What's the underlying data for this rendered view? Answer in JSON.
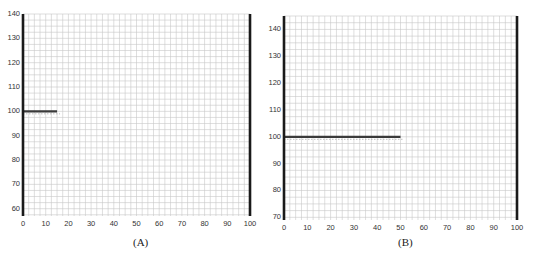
{
  "chart_data": [
    {
      "type": "line",
      "panel_label": "(A)",
      "xlim": [
        0,
        100
      ],
      "ylim": [
        57,
        140
      ],
      "xticks": [
        0,
        10,
        20,
        30,
        40,
        50,
        60,
        70,
        80,
        90,
        100
      ],
      "yticks": [
        60,
        70,
        80,
        90,
        100,
        110,
        120,
        130,
        140
      ],
      "grid": true,
      "xlabel": "",
      "ylabel": "",
      "series": [
        {
          "name": "segment",
          "x": [
            0,
            15
          ],
          "y": [
            100,
            100
          ]
        }
      ],
      "boundaries": [
        {
          "x": 0
        },
        {
          "x": 100
        }
      ]
    },
    {
      "type": "line",
      "panel_label": "(B)",
      "xlim": [
        0,
        100
      ],
      "ylim": [
        69,
        145
      ],
      "xticks": [
        0,
        10,
        20,
        30,
        40,
        50,
        60,
        70,
        80,
        90,
        100
      ],
      "yticks": [
        70,
        80,
        90,
        100,
        110,
        120,
        130,
        140
      ],
      "grid": true,
      "xlabel": "",
      "ylabel": "",
      "series": [
        {
          "name": "segment",
          "x": [
            0,
            50
          ],
          "y": [
            100,
            100
          ]
        }
      ],
      "boundaries": [
        {
          "x": 0
        },
        {
          "x": 100
        }
      ]
    }
  ],
  "panels": [
    {
      "caption": "(A)",
      "left": 23,
      "top": 14,
      "width": 227,
      "height": 202,
      "caption_x": 133,
      "caption_y": 236
    },
    {
      "caption": "(B)",
      "left": 284,
      "top": 16,
      "width": 233,
      "height": 204,
      "caption_x": 398,
      "caption_y": 236
    }
  ],
  "colors": {
    "grid": "#c8c8c8",
    "axis": "#1a1a1a",
    "series": "#3a3a3a",
    "guide": "#b0b0b0"
  }
}
